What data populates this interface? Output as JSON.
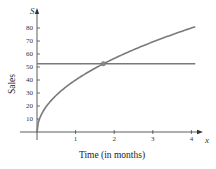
{
  "chart_data": {
    "type": "line",
    "title": "",
    "xlabel": "Time (in months)",
    "ylabel": "Sales",
    "x_axis_variable": "x",
    "y_axis_variable": "S",
    "x_ticks": [
      "1",
      "2",
      "3",
      "4"
    ],
    "y_ticks": [
      "10",
      "20",
      "30",
      "40",
      "50",
      "60",
      "70",
      "80"
    ],
    "xlim": [
      0,
      4.2
    ],
    "ylim": [
      0,
      87
    ],
    "grid": false,
    "legend": null,
    "series": [
      {
        "name": "sales curve",
        "x": [
          0,
          0.05,
          0.1,
          0.25,
          0.5,
          0.75,
          1,
          1.5,
          1.72,
          2,
          2.5,
          3,
          3.5,
          4,
          4.1
        ],
        "values": [
          0,
          8.9,
          12.6,
          20,
          28.3,
          34.6,
          40,
          49,
          52.5,
          56.6,
          63.2,
          69.3,
          74.8,
          80,
          81
        ],
        "color": "#7a7a7a"
      },
      {
        "name": "horizontal line",
        "x": [
          0,
          4.1
        ],
        "values": [
          52.5,
          52.5
        ],
        "color": "#7a7a7a"
      }
    ],
    "annotations": [
      {
        "type": "point",
        "x": 1.72,
        "y": 52.5,
        "label": "intersection"
      }
    ]
  },
  "colors": {
    "axis": "#333333",
    "curve": "#7a7a7a",
    "point": "#8a8a8a"
  }
}
